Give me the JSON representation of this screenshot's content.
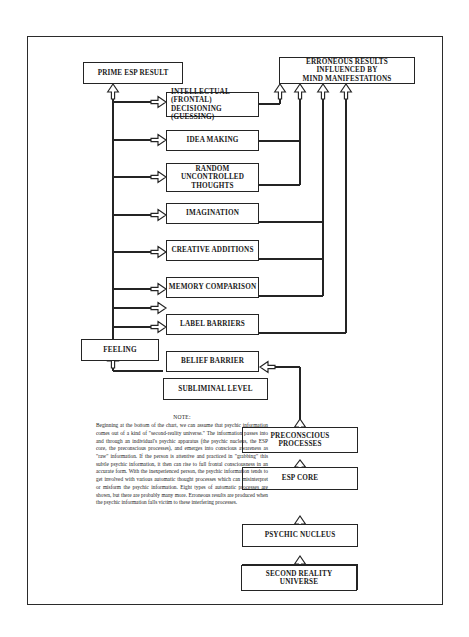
{
  "diagram": {
    "title_boxes": {
      "prime": "PRIME ESP RESULT",
      "erroneous_l1": "ERRONEOUS RESULTS",
      "erroneous_l2": "INFLUENCED BY",
      "erroneous_l3": "MIND MANIFESTATIONS"
    },
    "process_boxes": [
      {
        "name": "intellectual-decisioning",
        "line1": "INTELLECTUAL",
        "paren1": "(FRONTAL)",
        "line2": "DECISIONING",
        "paren2": "(GUESSING)"
      },
      {
        "name": "idea-making",
        "lines": [
          "IDEA MAKING"
        ]
      },
      {
        "name": "random-uncontrolled-thoughts",
        "lines": [
          "RANDOM",
          "UNCONTROLLED",
          "THOUGHTS"
        ]
      },
      {
        "name": "imagination",
        "lines": [
          "IMAGINATION"
        ]
      },
      {
        "name": "creative-additions",
        "lines": [
          "CREATIVE ADDITIONS"
        ]
      },
      {
        "name": "memory-comparison",
        "lines": [
          "MEMORY COMPARISON"
        ]
      },
      {
        "name": "label-barriers",
        "lines": [
          "LABEL BARRIERS"
        ]
      },
      {
        "name": "belief-barrier",
        "lines": [
          "BELIEF BARRIER"
        ]
      }
    ],
    "feeling_box": "FEELING",
    "subliminal_box": "SUBLIMINAL LEVEL",
    "pathway_boxes": [
      {
        "name": "preconscious-processes",
        "lines": [
          "PRECONSCIOUS",
          "PROCESSES"
        ]
      },
      {
        "name": "esp-core",
        "lines": [
          "ESP CORE"
        ]
      },
      {
        "name": "psychic-nucleus",
        "lines": [
          "PSYCHIC NUCLEUS"
        ]
      },
      {
        "name": "psychic-information-selected",
        "lines": [
          "PSYCHIC INFORMATION",
          "SELECTED"
        ]
      },
      {
        "name": "second-reality-universe",
        "lines": [
          "SECOND REALITY",
          "UNIVERSE"
        ]
      }
    ],
    "note": {
      "heading": "NOTE:",
      "body": "Beginning at the bottom of the chart, we can assume that psychic information comes out of a kind of \"second-reality universe.\" The information passes into and through an individual's psychic apparatus (the psychic nucleus, the ESP core, the preconscious processes), and emerges into conscious awareness as \"raw\" information. If the person is attentive and practiced in \"grabbing\" this subtle psychic information, it then can rise to full frontal consciousness in an accurate form. With the inexperienced person, the psychic information tends to get involved with various automatic thought processes which can misinterpret or misform the psychic information. Eight types of automatic processes are shown, but there are probably many more. Erroneous results are produced when the psychic information falls victim to these interfering processes."
    },
    "colors": {
      "ink": "#242424",
      "frame": "#2b2b2b",
      "paper": "#ffffff"
    }
  }
}
